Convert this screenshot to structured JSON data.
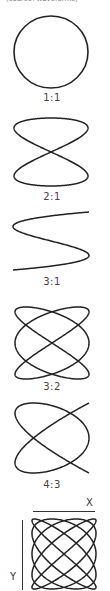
{
  "header": {
    "cutoff_text": "(source: waveforms)"
  },
  "figures": [
    {
      "ratio": "1:1",
      "a": 1,
      "b": 1,
      "delta": 1.5708,
      "label_top": 93
    },
    {
      "ratio": "2:1",
      "a": 2,
      "b": 1,
      "delta": 0,
      "label_top": 192
    },
    {
      "ratio": "3:1",
      "a": 3,
      "b": 1,
      "delta": 1.5708,
      "label_top": 277
    },
    {
      "ratio": "3:2",
      "a": 3,
      "b": 2,
      "delta": 1.5708,
      "label_top": 381
    },
    {
      "ratio": "4:3",
      "a": 4,
      "b": 3,
      "delta": 0.3927,
      "label_top": 479
    },
    {
      "ratio": "5:4",
      "a": 5,
      "b": 4,
      "delta": 1.5708,
      "label_top": null
    }
  ],
  "axes": {
    "x_label": "X",
    "y_label": "Y"
  },
  "colors": {
    "stroke": "#222222",
    "label": "#444444"
  }
}
